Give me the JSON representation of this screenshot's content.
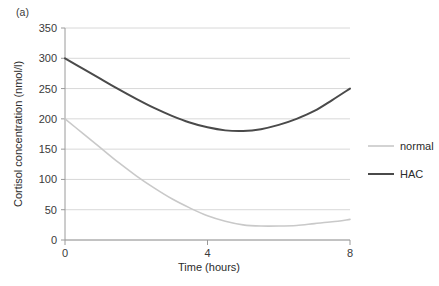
{
  "panel": {
    "label": "(a)"
  },
  "chart_data": {
    "type": "line",
    "title": "",
    "subtitle": "",
    "xlabel": "Time (hours)",
    "ylabel": "Cortisol concentration (nmol/l)",
    "xlim": [
      0,
      8
    ],
    "ylim": [
      0,
      350
    ],
    "xticks": [
      0,
      4,
      8
    ],
    "xticklabels": [
      "0",
      "4",
      "8"
    ],
    "yticks": [
      0,
      50,
      100,
      150,
      200,
      250,
      300,
      350
    ],
    "yticklabels": [
      "0",
      "50",
      "100",
      "150",
      "200",
      "250",
      "300",
      "350"
    ],
    "grid": "horizontal",
    "legend_position": "right",
    "x": [
      0,
      0.5,
      1,
      1.5,
      2,
      2.5,
      3,
      3.5,
      4,
      4.5,
      5,
      5.5,
      6,
      6.5,
      7,
      7.5,
      8
    ],
    "series": [
      {
        "name": "normal",
        "color": "#c9c9c9",
        "width": 1.6,
        "values": [
          200,
          176,
          152,
          128,
          106,
          86,
          68,
          53,
          40,
          31,
          25,
          23,
          23,
          24,
          27,
          30,
          34
        ]
      },
      {
        "name": "HAC",
        "color": "#4a4a4a",
        "width": 2.0,
        "values": [
          300,
          283,
          266,
          249,
          233,
          218,
          205,
          194,
          186,
          181,
          180,
          183,
          190,
          200,
          213,
          231,
          250
        ]
      }
    ],
    "annotations": []
  },
  "legend": {
    "items": [
      {
        "label": "normal",
        "color": "#c9c9c9"
      },
      {
        "label": "HAC",
        "color": "#4a4a4a"
      }
    ]
  },
  "colors": {
    "grid": "#d8d8d8",
    "axis": "#9a9a9a",
    "text": "#2b2b2b",
    "background": "#ffffff"
  }
}
